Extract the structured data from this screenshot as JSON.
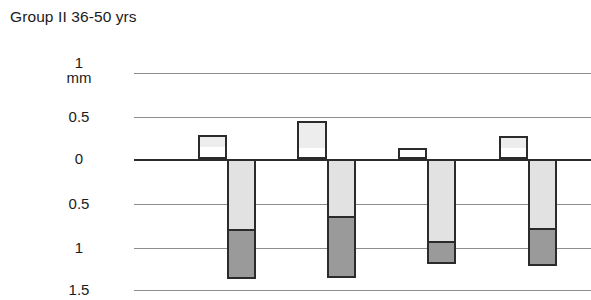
{
  "chart": {
    "title": "Group II 36-50 yrs",
    "unit_label": "mm"
  },
  "axis": {
    "ticks": [
      {
        "label": "1",
        "unit": "mm",
        "value": 1.0,
        "y": 73
      },
      {
        "label": "0.5",
        "unit": "",
        "value": 0.5,
        "y": 117
      },
      {
        "label": "0",
        "unit": "",
        "value": 0.0,
        "y": 159
      },
      {
        "label": "0.5",
        "unit": "",
        "value": -0.5,
        "y": 204
      },
      {
        "label": "1",
        "unit": "",
        "value": -1.0,
        "y": 248
      },
      {
        "label": "1.5",
        "unit": "",
        "value": -1.5,
        "y": 290
      }
    ]
  },
  "colors": {
    "positive_upper": "#ededed",
    "positive_lower": "#ffffff",
    "negative_upper": "#e2e2e2",
    "negative_lower": "#9a9a9a",
    "outline": "#2b2b2b",
    "gridline": "#8d8d8d",
    "zeroline": "#2b2b2b",
    "background": "#ffffff"
  },
  "chart_data": {
    "type": "bar",
    "title": "Group II 36-50 yrs",
    "xlabel": "",
    "ylabel": "mm",
    "ylim": [
      -1.5,
      1.0
    ],
    "y_tick_labels": [
      "1 mm",
      "0.5",
      "0",
      "0.5",
      "1",
      "1.5"
    ],
    "y_tick_values": [
      1.0,
      0.5,
      0.0,
      -0.5,
      -1.0,
      -1.5
    ],
    "grid": true,
    "legend": "none",
    "note": "Each of 4 measurement sites shows a stacked positive bar (open box, divided) to the left and a stacked negative bar (light grey over dark grey) to the right.",
    "categories": [
      "Site 1",
      "Site 2",
      "Site 3",
      "Site 4"
    ],
    "series": [
      {
        "name": "Positive upper (open, light)",
        "values": [
          0.16,
          0.33,
          0.12,
          0.16
        ]
      },
      {
        "name": "Positive lower (open, white)",
        "values": [
          0.1,
          0.09,
          0.0,
          0.09
        ]
      },
      {
        "name": "Negative upper (light grey)",
        "values": [
          -0.84,
          -0.69,
          -0.97,
          -0.83
        ]
      },
      {
        "name": "Negative lower (dark grey)",
        "values": [
          -0.55,
          -0.69,
          -0.24,
          -0.41
        ]
      }
    ],
    "positive_totals": [
      0.26,
      0.42,
      0.12,
      0.25
    ],
    "negative_totals": [
      -1.39,
      -1.38,
      -1.21,
      -1.24
    ]
  },
  "bars": [
    {
      "name": "bar-group-1",
      "pos_x": 198,
      "pos_w": 29,
      "pos_top_y": 135,
      "pos_divider_y": 149,
      "pos_bottom_y": 159,
      "neg_x": 227,
      "neg_w": 29,
      "neg_top_y": 159,
      "neg_divider_y": 231,
      "neg_bottom_y": 279
    },
    {
      "name": "bar-group-2",
      "pos_x": 297,
      "pos_w": 30,
      "pos_top_y": 121,
      "pos_divider_y": 150,
      "pos_bottom_y": 159,
      "neg_x": 327,
      "neg_w": 29,
      "neg_top_y": 159,
      "neg_divider_y": 218,
      "neg_bottom_y": 278
    },
    {
      "name": "bar-group-3",
      "pos_x": 398,
      "pos_w": 29,
      "pos_top_y": 148,
      "pos_divider_y": 159,
      "pos_bottom_y": 159,
      "neg_x": 427,
      "neg_w": 29,
      "neg_top_y": 159,
      "neg_divider_y": 243,
      "neg_bottom_y": 264
    },
    {
      "name": "bar-group-4",
      "pos_x": 499,
      "pos_w": 29,
      "pos_top_y": 136,
      "pos_divider_y": 150,
      "pos_bottom_y": 159,
      "neg_x": 528,
      "neg_w": 29,
      "neg_top_y": 159,
      "neg_divider_y": 230,
      "neg_bottom_y": 266
    }
  ]
}
